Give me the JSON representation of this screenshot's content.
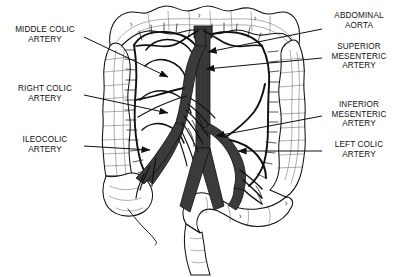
{
  "figure": {
    "type": "anatomical-line-diagram",
    "background_color": "#ffffff",
    "ink_color": "#111111",
    "vessel_fill_color": "#3b3b3b"
  },
  "labels": {
    "middle_colic_artery": "MIDDLE COLIC\nARTERY",
    "right_colic_artery": "RIGHT COLIC\nARTERY",
    "ileocolic_artery": "ILEOCOLIC\nARTERY",
    "abdominal_aorta": "ABDOMINAL\nAORTA",
    "superior_mesenteric_artery": "SUPERIOR\nMESENTERIC\nARTERY",
    "inferior_mesenteric_artery": "INFERIOR\nMESENTERIC\nARTERY",
    "left_colic_artery": "LEFT COLIC\nARTERY"
  },
  "structures": {
    "transverse_colon": "transverse-colon",
    "ascending_colon": "ascending-colon",
    "descending_colon": "descending-colon",
    "cecum": "cecum",
    "appendix": "appendix",
    "sigmoid_colon": "sigmoid-colon",
    "rectum": "rectum",
    "aorta_trunk": "abdominal-aorta-trunk",
    "marginal_artery": "marginal-artery-arcade",
    "jejunal_branches": "jejunal-ileal-branches"
  }
}
